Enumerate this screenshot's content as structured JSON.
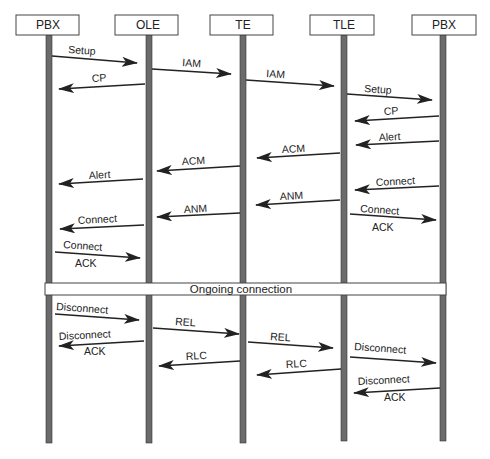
{
  "diagram": {
    "type": "sequence",
    "colors": {
      "lifeline": "#6b6b6b",
      "lifeline_border": "#333333",
      "arrow": "#222222",
      "box_border": "#444444",
      "background": "#ffffff"
    },
    "participants": [
      {
        "id": "pbx1",
        "label": "PBX"
      },
      {
        "id": "ole",
        "label": "OLE"
      },
      {
        "id": "te",
        "label": "TE"
      },
      {
        "id": "tle",
        "label": "TLE"
      },
      {
        "id": "pbx2",
        "label": "PBX"
      }
    ],
    "ongoing_bar": {
      "label": "Ongoing connection"
    },
    "messages": [
      {
        "from": "pbx1",
        "to": "ole",
        "label": "Setup"
      },
      {
        "from": "ole",
        "to": "te",
        "label": "IAM"
      },
      {
        "from": "ole",
        "to": "pbx1",
        "label": "CP"
      },
      {
        "from": "te",
        "to": "tle",
        "label": "IAM"
      },
      {
        "from": "tle",
        "to": "pbx2",
        "label": "Setup"
      },
      {
        "from": "pbx2",
        "to": "tle",
        "label": "CP"
      },
      {
        "from": "pbx2",
        "to": "tle",
        "label": "Alert"
      },
      {
        "from": "tle",
        "to": "te",
        "label": "ACM"
      },
      {
        "from": "te",
        "to": "ole",
        "label": "ACM"
      },
      {
        "from": "ole",
        "to": "pbx1",
        "label": "Alert"
      },
      {
        "from": "pbx2",
        "to": "tle",
        "label": "Connect"
      },
      {
        "from": "tle",
        "to": "te",
        "label": "ANM"
      },
      {
        "from": "tle",
        "to": "pbx2",
        "label": "Connect",
        "label2": "ACK"
      },
      {
        "from": "te",
        "to": "ole",
        "label": "ANM"
      },
      {
        "from": "ole",
        "to": "pbx1",
        "label": "Connect"
      },
      {
        "from": "pbx1",
        "to": "ole",
        "label": "Connect",
        "label2": "ACK"
      },
      {
        "from": "pbx1",
        "to": "ole",
        "label": "Disconnect"
      },
      {
        "from": "ole",
        "to": "te",
        "label": "REL"
      },
      {
        "from": "ole",
        "to": "pbx1",
        "label": "Disconnect",
        "label2": "ACK"
      },
      {
        "from": "te",
        "to": "tle",
        "label": "REL"
      },
      {
        "from": "te",
        "to": "ole",
        "label": "RLC"
      },
      {
        "from": "tle",
        "to": "pbx2",
        "label": "Disconnect"
      },
      {
        "from": "tle",
        "to": "te",
        "label": "RLC"
      },
      {
        "from": "pbx2",
        "to": "tle",
        "label": "Disconnect",
        "label2": "ACK"
      }
    ]
  }
}
